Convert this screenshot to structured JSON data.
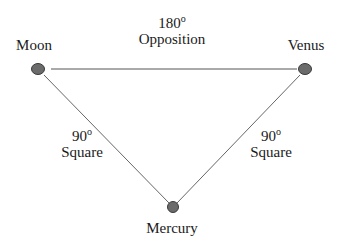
{
  "diagram": {
    "type": "astrological-aspect-triangle",
    "nodes": [
      {
        "id": "moon",
        "label": "Moon",
        "x": 38,
        "y": 69
      },
      {
        "id": "venus",
        "label": "Venus",
        "x": 305,
        "y": 69
      },
      {
        "id": "mercury",
        "label": "Mercury",
        "x": 173,
        "y": 207
      }
    ],
    "edges": [
      {
        "from": "moon",
        "to": "venus",
        "degrees": "180",
        "degree_symbol": "o",
        "aspect": "Opposition"
      },
      {
        "from": "moon",
        "to": "mercury",
        "degrees": "90",
        "degree_symbol": "o",
        "aspect": "Square"
      },
      {
        "from": "venus",
        "to": "mercury",
        "degrees": "90",
        "degree_symbol": "o",
        "aspect": "Square"
      }
    ],
    "colors": {
      "node_fill": "#6b6b6b",
      "node_stroke": "#3a3a3a",
      "line": "#555555",
      "text": "#1a1a1a"
    }
  }
}
